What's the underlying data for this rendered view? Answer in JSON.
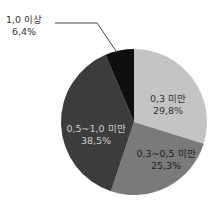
{
  "chart_data": {
    "type": "pie",
    "title": "",
    "start_angle": "12 o'clock, clockwise",
    "slices": [
      {
        "label": "0,3 미만",
        "value": 29.8,
        "value_label": "29,8%",
        "color": "#c4c4c4",
        "text_color": "#333333"
      },
      {
        "label": "0,3~0,5 미만",
        "value": 25.3,
        "value_label": "25,3%",
        "color": "#7a7a7a",
        "text_color": "#222222"
      },
      {
        "label": "0,5~1,0 미만",
        "value": 38.5,
        "value_label": "38,5%",
        "color": "#3c3c3c",
        "text_color": "#cfcfcf"
      },
      {
        "label": "1,0 이상",
        "value": 6.4,
        "value_label": "6,4%",
        "color": "#0f0f0f",
        "text_color": "#333333",
        "callout": true
      }
    ]
  }
}
